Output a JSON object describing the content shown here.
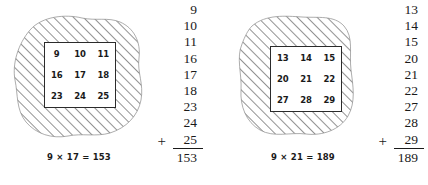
{
  "figures": [
    {
      "id": "left",
      "grid": {
        "rows": [
          [
            "9",
            "10",
            "11"
          ],
          [
            "16",
            "17",
            "18"
          ],
          [
            "23",
            "24",
            "25"
          ]
        ]
      },
      "caption": "9 × 17 = 153",
      "sum": {
        "addends": [
          "9",
          "10",
          "11",
          "16",
          "17",
          "18",
          "23",
          "24"
        ],
        "plus_sign": "+",
        "last_addend": "25",
        "total": "153"
      }
    },
    {
      "id": "right",
      "grid": {
        "rows": [
          [
            "13",
            "14",
            "15"
          ],
          [
            "20",
            "21",
            "22"
          ],
          [
            "27",
            "28",
            "29"
          ]
        ]
      },
      "caption": "9 × 21 = 189",
      "sum": {
        "addends": [
          "13",
          "14",
          "15",
          "20",
          "21",
          "22",
          "27",
          "28"
        ],
        "plus_sign": "+",
        "last_addend": "29",
        "total": "189"
      }
    }
  ],
  "style": {
    "hatch_color": "#6e6e6e",
    "blob_outline_color": "#8a8a8a",
    "ink_color": "#1a1a1a",
    "background": "#ffffff"
  }
}
